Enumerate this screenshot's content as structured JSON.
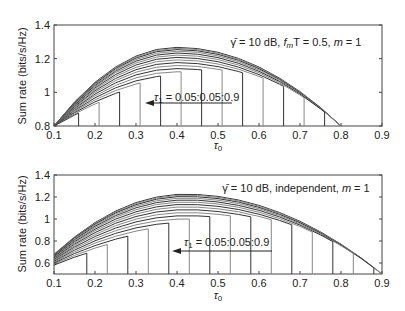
{
  "chart_data": [
    {
      "type": "line",
      "title": "",
      "xlabel": "τ0",
      "ylabel": "Sum rate (bits/s/Hz)",
      "xlim": [
        0.1,
        0.9
      ],
      "ylim": [
        0.8,
        1.4
      ],
      "xticks": [
        "0.1",
        "0.2",
        "0.3",
        "0.4",
        "0.5",
        "0.6",
        "0.7",
        "0.8",
        "0.9"
      ],
      "yticks": [
        "0.8",
        "1",
        "1.2",
        "1.4"
      ],
      "annotation": "γ̄ = 10 dB, f_mT = 0.5, m = 1",
      "arrow_label": "τ1 = 0.05:0.05:0.9",
      "peak": 1.27,
      "peak_x": 0.4,
      "end_x": 0.8,
      "start_y": 0.8,
      "series_note": "family of curves for τ1 = 0.05:0.05:0.9; each ends with a vertical drop"
    },
    {
      "type": "line",
      "title": "",
      "xlabel": "τ0",
      "ylabel": "Sum rate (bits/s/Hz)",
      "xlim": [
        0.1,
        0.9
      ],
      "ylim": [
        0.5,
        1.4
      ],
      "xticks": [
        "0.1",
        "0.2",
        "0.3",
        "0.4",
        "0.5",
        "0.6",
        "0.7",
        "0.8",
        "0.9"
      ],
      "yticks": [
        "0.6",
        "0.8",
        "1",
        "1.2",
        "1.4"
      ],
      "annotation": "γ̄ = 10 dB, independent, m = 1",
      "arrow_label": "τ1 = 0.05:0.05:0.9",
      "peak": 1.23,
      "peak_x": 0.42,
      "end_x": 0.9,
      "start_y": 0.68,
      "series_note": "family of curves for τ1 = 0.05:0.05:0.9; each ends with a vertical drop"
    }
  ],
  "plots": [
    {
      "annotation_pre": "γ̄ = 10 dB, ",
      "annotation_fm": "f",
      "annotation_sub": "m",
      "annotation_post": "T = 0.5, ",
      "annotation_m": "m",
      "annotation_end": " = 1",
      "arrow_label": "τ",
      "arrow_sub": "1",
      "arrow_rest": " = 0.05:0.05:0.9",
      "xlabel": "τ",
      "xlabel_sub": "0",
      "ylabel": "Sum rate (bits/s/Hz)"
    },
    {
      "annotation_pre": "γ̄ = 10 dB, independent, ",
      "annotation_m": "m",
      "annotation_end": " = 1",
      "arrow_label": "τ",
      "arrow_sub": "1",
      "arrow_rest": " = 0.05:0.05:0.9",
      "xlabel": "τ",
      "xlabel_sub": "0",
      "ylabel": "Sum rate (bits/s/Hz)"
    }
  ]
}
